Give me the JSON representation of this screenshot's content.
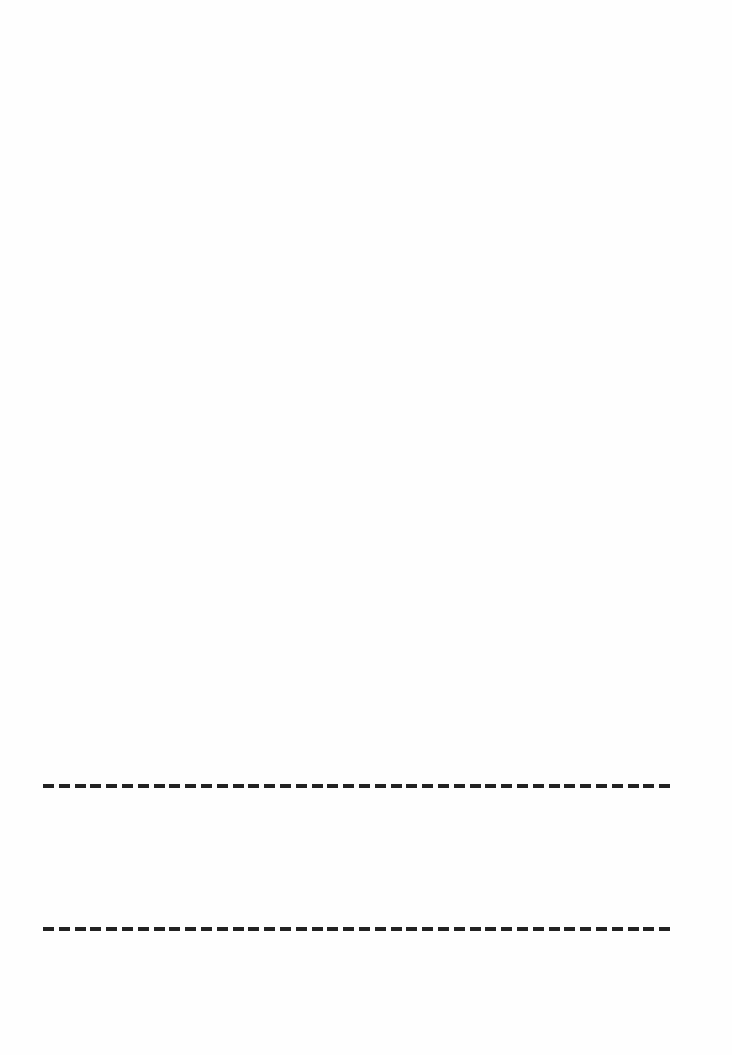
{
  "document": {
    "type": "blank-page",
    "background_color": "#ffffff",
    "rules": [
      {
        "style": "dashed",
        "color": "#222222",
        "y": 786
      },
      {
        "style": "dashed",
        "color": "#222222",
        "y": 929
      }
    ]
  }
}
